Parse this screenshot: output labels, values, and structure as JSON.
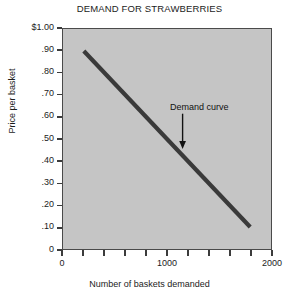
{
  "chart_data": {
    "type": "line",
    "title": "DEMAND FOR STRAWBERRIES",
    "xlabel": "Number of baskets demanded",
    "ylabel": "Price per basket",
    "xlim": [
      0,
      2000
    ],
    "ylim": [
      0,
      1.0
    ],
    "grid": false,
    "legend_position": "none",
    "background_color": "#c5c5c5",
    "line_color": "#3a3a3a",
    "x_ticks": [
      0,
      200,
      400,
      600,
      800,
      1000,
      1200,
      1400,
      1600,
      1800,
      2000
    ],
    "x_tick_labels": [
      "0",
      "",
      "",
      "",
      "",
      "1000",
      "",
      "",
      "",
      "",
      "2000"
    ],
    "y_ticks": [
      0,
      0.1,
      0.2,
      0.3,
      0.4,
      0.5,
      0.6,
      0.7,
      0.8,
      0.9,
      1.0
    ],
    "y_tick_labels": [
      "0",
      ".10",
      ".20",
      ".30",
      ".40",
      ".50",
      ".60",
      ".70",
      ".80",
      ".90",
      "$1.00"
    ],
    "series": [
      {
        "name": "Demand curve",
        "x": [
          200,
          1800
        ],
        "y": [
          0.9,
          0.1
        ]
      }
    ],
    "annotations": [
      {
        "text": "Demand curve",
        "text_x": 1020,
        "text_y": 0.645,
        "arrow_x": 1150,
        "arrow_from_y": 0.615,
        "arrow_to_y": 0.455
      }
    ]
  }
}
